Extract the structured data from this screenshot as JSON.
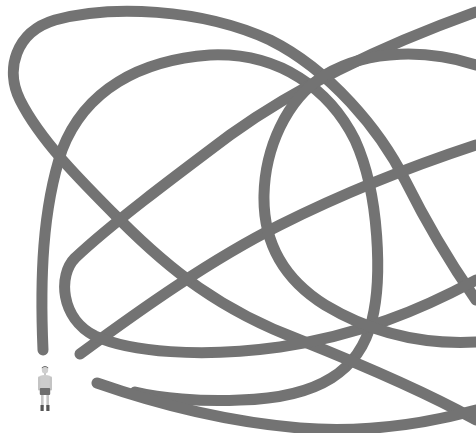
{
  "illustration": {
    "title": "Tangled line with standing man for scale",
    "line_color": "#737373",
    "background_color": "#ffffff",
    "figure": {
      "label": "standing-man",
      "skin_color": "#c8c8c8",
      "shorts_color": "#6e6e6e",
      "hair_color": "#555555",
      "boots_color": "#555555"
    },
    "strands": [
      "left-arch",
      "top-outer-loop",
      "rising-diagonal",
      "lower-loop",
      "right-ellipse",
      "bottom-tail"
    ]
  }
}
